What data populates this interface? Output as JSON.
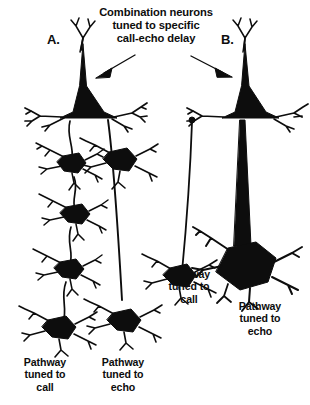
{
  "figure": {
    "kind": "neuroanatomy-diagram",
    "background_color": "#ffffff",
    "ink_color": "#0d0d0d",
    "title": "Combination neurons\ntuned to specific\ncall-echo delay",
    "panels": [
      {
        "letter": "A.",
        "description": "Combination neuron fed by a long multi-synaptic call pathway and a shorter echo pathway",
        "pathway_labels": [
          "Pathway\ntuned to\ncall",
          "Pathway\ntuned to\necho"
        ]
      },
      {
        "letter": "B.",
        "description": "Combination neuron fed by a thin slow call axon and a thick fast echo axon",
        "pathway_labels": [
          "Pathway\ntuned to\ncall",
          "Pathway\ntuned to\necho"
        ]
      }
    ],
    "annotations": {
      "title_text": "Combination neurons\ntuned to specific\ncall-echo delay",
      "panel_a_letter": "A.",
      "panel_b_letter": "B.",
      "label_a_call": "Pathway\ntuned to\ncall",
      "label_a_echo": "Pathway\ntuned to\necho",
      "label_b_call": "Pathway\ntuned to\ncall",
      "label_b_echo": "Pathway\ntuned to\necho",
      "arrow_left": "arrow-pointing-to-neuron-a",
      "arrow_right": "arrow-pointing-to-neuron-b"
    }
  }
}
